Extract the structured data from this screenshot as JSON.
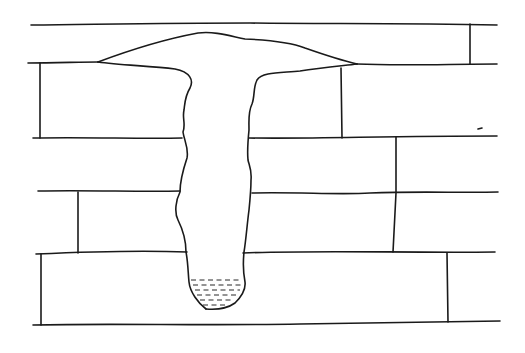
{
  "figure": {
    "description": "Line drawing of a brick wall cross-section with a mushroom-shaped cavity: a wide dome along the top joint and a narrow vertical shaft descending through the courses, ending in a rounded pocket partially filled with liquid (shown by dashes).",
    "stroke_color": "#1a1a1a",
    "background_color": "#ffffff",
    "parts": {
      "wall": "brick courses",
      "cap": "dome-shaped cavity top",
      "shaft": "vertical cavity",
      "pool": "liquid at cavity bottom"
    }
  }
}
